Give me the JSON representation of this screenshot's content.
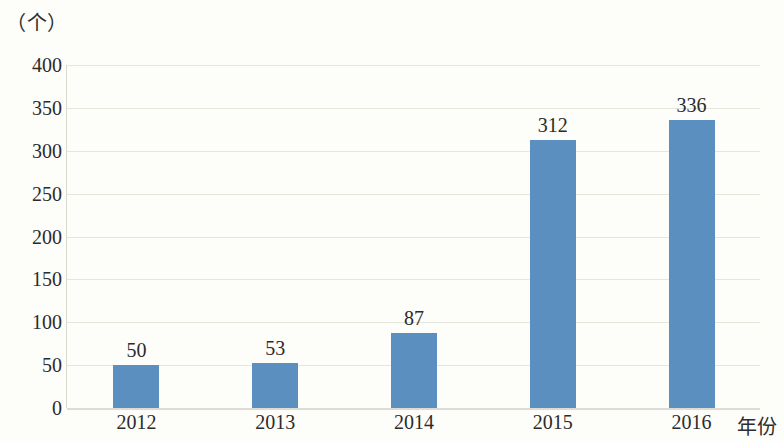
{
  "chart_data": {
    "type": "bar",
    "title": "",
    "subtitle": "",
    "xlabel": "年份",
    "ylabel": "（个）",
    "categories": [
      "2012",
      "2013",
      "2014",
      "2015",
      "2016"
    ],
    "values": [
      50,
      53,
      87,
      312,
      336
    ],
    "value_labels": [
      "50",
      "53",
      "87",
      "312",
      "336"
    ],
    "series": [
      {
        "name": "数量",
        "values": [
          50,
          53,
          87,
          312,
          336
        ]
      }
    ],
    "ylim": [
      0,
      400
    ],
    "y_ticks": [
      400,
      350,
      300,
      250,
      200,
      150,
      100,
      50,
      0
    ],
    "y_tick_labels": [
      "400",
      "350",
      "300",
      "250",
      "200",
      "150",
      "100",
      "50",
      "0"
    ],
    "grid": true,
    "legend": false,
    "legend_position": "none",
    "bar_color": "#5b8fc0",
    "gridline_color": "#e6e6dc",
    "axis_color": "#d9d9d0",
    "background_color": "#fdfdfa",
    "text_color": "#2b2b2b",
    "data_labels_shown": true
  }
}
